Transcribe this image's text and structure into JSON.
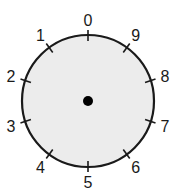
{
  "dial": {
    "face_color": "#ececec",
    "stroke_color": "#1a1a1a",
    "center_dot_color": "#000000",
    "labels": [
      {
        "text": "0",
        "angle": 0
      },
      {
        "text": "9",
        "angle": 36
      },
      {
        "text": "8",
        "angle": 72
      },
      {
        "text": "7",
        "angle": 108
      },
      {
        "text": "6",
        "angle": 144
      },
      {
        "text": "5",
        "angle": 180
      },
      {
        "text": "4",
        "angle": 216
      },
      {
        "text": "3",
        "angle": 252
      },
      {
        "text": "2",
        "angle": 288
      },
      {
        "text": "1",
        "angle": 324
      }
    ]
  }
}
